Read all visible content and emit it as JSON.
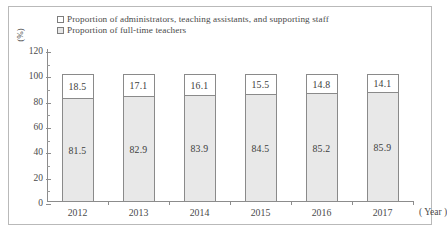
{
  "chart_data": {
    "type": "bar",
    "subtype": "stacked-column-100",
    "title": "",
    "xlabel": "( Year )",
    "ylabel": "(%)",
    "categories": [
      "2012",
      "2013",
      "2014",
      "2015",
      "2016",
      "2017"
    ],
    "ylim": [
      0,
      120
    ],
    "yticks": [
      0,
      20,
      40,
      60,
      80,
      100,
      120
    ],
    "ytick_labels": [
      "0",
      "20",
      "40",
      "60",
      "80",
      "100",
      "120"
    ],
    "grid": false,
    "legend_position": "top-left",
    "series": [
      {
        "name": "Proportion of administrators, teaching assistants, and supporting staff",
        "color": "#ffffff",
        "values": [
          18.5,
          17.1,
          16.1,
          15.5,
          14.8,
          14.1
        ],
        "labels": [
          "18.5",
          "17.1",
          "16.1",
          "15.5",
          "14.8",
          "14.1"
        ]
      },
      {
        "name": "Proportion of full-time teachers",
        "color": "#e8e8e8",
        "values": [
          81.5,
          82.9,
          83.9,
          84.5,
          85.2,
          85.9
        ],
        "labels": [
          "81.5",
          "82.9",
          "83.9",
          "84.5",
          "85.2",
          "85.9"
        ]
      }
    ]
  },
  "legend": {
    "items": [
      {
        "label": "Proportion of administrators, teaching assistants, and supporting staff"
      },
      {
        "label": "Proportion of full-time teachers"
      }
    ]
  },
  "axes": {
    "y_unit": "(%)",
    "x_unit": "( Year )"
  }
}
